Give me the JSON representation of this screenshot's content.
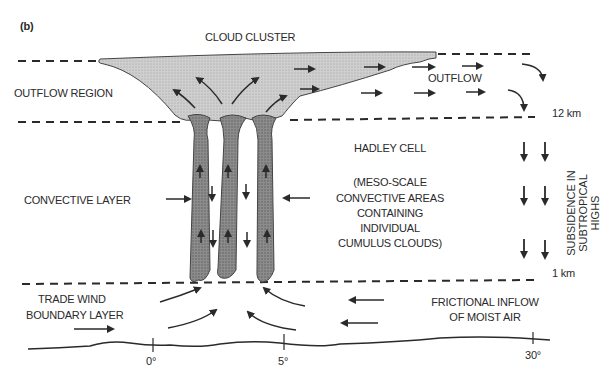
{
  "panel_label": "(b)",
  "title": "CLOUD CLUSTER",
  "labels": {
    "outflow_region": "OUTFLOW REGION",
    "outflow": "OUTFLOW",
    "level_12km": "12 km",
    "level_1km": "1 km",
    "hadley_cell": "HADLEY CELL",
    "meso_line1": "(MESO-SCALE",
    "meso_line2": "CONVECTIVE AREAS",
    "meso_line3": "CONTAINING",
    "meso_line4": "INDIVIDUAL",
    "meso_line5": "CUMULUS CLOUDS)",
    "convective_layer": "CONVECTIVE LAYER",
    "subsidence_line1": "SUBSIDENCE IN",
    "subsidence_line2": "SUBTROPICAL",
    "subsidence_line3": "HIGHS",
    "trade_wind_line1": "TRADE WIND",
    "trade_wind_line2": "BOUNDARY LAYER",
    "frictional_line1": "FRICTIONAL INFLOW",
    "frictional_line2": "OF MOIST AIR"
  },
  "axis": {
    "ticks": [
      "0°",
      "5°",
      "30°"
    ]
  },
  "colors": {
    "cloud_fill": "#c8c8c8",
    "column_fill": "#8a8a8a",
    "ink": "#2a2a2a"
  }
}
